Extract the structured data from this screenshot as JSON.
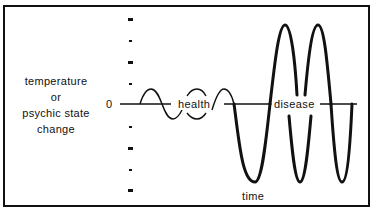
{
  "diagram": {
    "y_axis_label_lines": [
      "temperature",
      "or",
      "psychic state",
      "change"
    ],
    "zero_label": "0",
    "x_axis_label": "time",
    "region_labels": {
      "health": "health",
      "disease": "disease"
    },
    "colors": {
      "line": "#111111",
      "background": "#ffffff"
    }
  }
}
